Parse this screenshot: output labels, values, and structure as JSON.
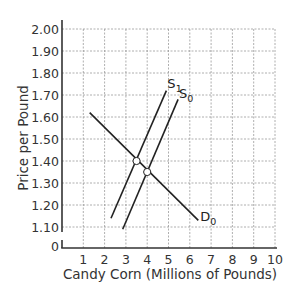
{
  "chart_data": {
    "type": "line",
    "title": "",
    "xlabel": "Candy Corn (Millions of Pounds)",
    "ylabel": "Price per Pound",
    "xlim": [
      0,
      10
    ],
    "ylim": [
      1.0,
      2.0
    ],
    "y_axis_break": true,
    "grid": true,
    "x_ticks": [
      "1",
      "2",
      "3",
      "4",
      "5",
      "6",
      "7",
      "8",
      "9",
      "10"
    ],
    "y_ticks": [
      "0",
      "1.10",
      "1.20",
      "1.30",
      "1.40",
      "1.50",
      "1.60",
      "1.70",
      "1.80",
      "1.90",
      "2.00"
    ],
    "series": [
      {
        "name": "D0",
        "label_main": "D",
        "label_sub": "0",
        "points": [
          [
            1.3,
            1.62
          ],
          [
            6.4,
            1.13
          ]
        ]
      },
      {
        "name": "S1",
        "label_main": "S",
        "label_sub": "1",
        "points": [
          [
            2.3,
            1.14
          ],
          [
            4.9,
            1.72
          ]
        ]
      },
      {
        "name": "S0",
        "label_main": "S",
        "label_sub": "0",
        "points": [
          [
            2.85,
            1.09
          ],
          [
            5.45,
            1.68
          ]
        ]
      }
    ],
    "annotations": [
      {
        "type": "equilibrium-point",
        "x": 3.5,
        "y": 1.4,
        "between": [
          "S1",
          "D0"
        ]
      },
      {
        "type": "equilibrium-point",
        "x": 4.0,
        "y": 1.35,
        "between": [
          "S0",
          "D0"
        ]
      }
    ],
    "colors": {
      "line": "#222222",
      "grid": "#9a9a9a",
      "axis": "#333333"
    }
  }
}
